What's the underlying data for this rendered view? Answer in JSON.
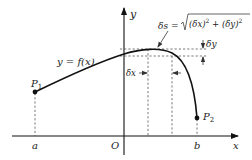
{
  "diagram": {
    "axes": {
      "x_label": "x",
      "y_label": "y",
      "origin_label": "O"
    },
    "curve_label": "y = f(x)",
    "points": [
      {
        "id": "P1",
        "label": "P",
        "subscript": "1",
        "x_label": "a"
      },
      {
        "id": "P2",
        "label": "P",
        "subscript": "2",
        "x_label": "b"
      }
    ],
    "annotations": {
      "ds_lhs": "δs = ",
      "ds_rad_open": "(δx)",
      "ds_exp1": "2",
      "ds_plus": " + ",
      "ds_rad_close": "(δy)",
      "ds_exp2": "2",
      "dx_label": "δx",
      "dy_label": "δy"
    },
    "colors": {
      "stroke": "#111111",
      "dashed": "#555555",
      "text": "#222222",
      "background": "#ffffff"
    }
  }
}
